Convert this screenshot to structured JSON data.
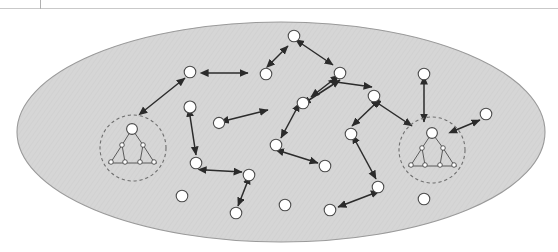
{
  "page": {
    "width": 558,
    "height": 252,
    "background": "#ffffff",
    "scan_rule": {
      "y": 8,
      "color": "#c9c9c9"
    },
    "scan_tick": {
      "x": 40,
      "height": 9,
      "color": "#b0b0b0"
    }
  },
  "figure": {
    "kind": "peer-to-peer network diagram",
    "universe": {
      "label": "network-boundary-ellipse",
      "cx": 281,
      "cy": 132,
      "rx": 264,
      "ry": 110,
      "fill": "#d6d6d6",
      "stroke": "#9a9a9a"
    },
    "colors": {
      "node_fill": "#ffffff",
      "node_stroke": "#4c4c4c",
      "arrow": "#2b2b2b",
      "group_ring": "#6f6f6f",
      "ellipse_fill": "#d6d6d6",
      "ellipse_stroke": "#9a9a9a"
    },
    "node_radius": 5.6,
    "nodes": [
      {
        "id": "n1",
        "cx": 190,
        "cy": 72,
        "r": 5.8
      },
      {
        "id": "n2",
        "cx": 266,
        "cy": 74,
        "r": 5.8
      },
      {
        "id": "n3",
        "cx": 294,
        "cy": 36,
        "r": 5.8
      },
      {
        "id": "n4",
        "cx": 340,
        "cy": 73,
        "r": 5.8
      },
      {
        "id": "n5",
        "cx": 374,
        "cy": 96,
        "r": 5.8
      },
      {
        "id": "n6",
        "cx": 424,
        "cy": 74,
        "r": 5.8
      },
      {
        "id": "n7",
        "cx": 190,
        "cy": 107,
        "r": 6.0
      },
      {
        "id": "n8",
        "cx": 219,
        "cy": 123,
        "r": 5.6
      },
      {
        "id": "n9",
        "cx": 303,
        "cy": 103,
        "r": 5.8
      },
      {
        "id": "n10",
        "cx": 351,
        "cy": 134,
        "r": 5.8
      },
      {
        "id": "n11",
        "cx": 486,
        "cy": 114,
        "r": 5.8
      },
      {
        "id": "n12",
        "cx": 276,
        "cy": 145,
        "r": 5.8
      },
      {
        "id": "n13",
        "cx": 196,
        "cy": 163,
        "r": 5.8
      },
      {
        "id": "n14",
        "cx": 249,
        "cy": 175,
        "r": 5.8
      },
      {
        "id": "n15",
        "cx": 325,
        "cy": 166,
        "r": 5.8
      },
      {
        "id": "n16",
        "cx": 378,
        "cy": 187,
        "r": 5.8
      },
      {
        "id": "n17",
        "cx": 182,
        "cy": 196,
        "r": 5.8
      },
      {
        "id": "n18",
        "cx": 236,
        "cy": 213,
        "r": 5.8
      },
      {
        "id": "n19",
        "cx": 285,
        "cy": 205,
        "r": 5.8
      },
      {
        "id": "n20",
        "cx": 330,
        "cy": 210,
        "r": 5.8
      },
      {
        "id": "n21",
        "cx": 424,
        "cy": 199,
        "r": 5.8
      }
    ],
    "links": [
      {
        "from": "g-left",
        "to": "n1",
        "x1": 145,
        "y1": 110,
        "x2": 185,
        "y2": 78,
        "heads": "both"
      },
      {
        "from": "n1",
        "to": "n2",
        "x1": 208,
        "y1": 73,
        "x2": 248,
        "y2": 73,
        "heads": "both"
      },
      {
        "from": "n2",
        "to": "n3",
        "x1": 272,
        "y1": 62,
        "x2": 288,
        "y2": 46,
        "heads": "both"
      },
      {
        "from": "n3",
        "to": "n4",
        "x1": 302,
        "y1": 44,
        "x2": 333,
        "y2": 65,
        "heads": "both"
      },
      {
        "from": "n4",
        "to": "n5",
        "x1": 336,
        "y1": 82,
        "x2": 372,
        "y2": 87,
        "heads": "both"
      },
      {
        "from": "n5",
        "to": "n10",
        "x1": 374,
        "y1": 105,
        "x2": 352,
        "y2": 126,
        "heads": "both"
      },
      {
        "from": "n4",
        "to": "n9",
        "x1": 333,
        "y1": 80,
        "x2": 311,
        "y2": 97,
        "heads": "both"
      },
      {
        "from": "n9",
        "to": "n12",
        "x1": 296,
        "y1": 110,
        "x2": 281,
        "y2": 138,
        "heads": "both"
      },
      {
        "from": "n7",
        "to": "n13",
        "x1": 190,
        "y1": 116,
        "x2": 196,
        "y2": 155,
        "heads": "both"
      },
      {
        "from": "n8",
        "to": "n12",
        "x1": 228,
        "y1": 120,
        "x2": 268,
        "y2": 110,
        "heads": "both"
      },
      {
        "from": "n12",
        "to": "n15",
        "x1": 283,
        "y1": 152,
        "x2": 318,
        "y2": 163,
        "heads": "both"
      },
      {
        "from": "n14",
        "to": "n18",
        "x1": 247,
        "y1": 183,
        "x2": 238,
        "y2": 206,
        "heads": "both"
      },
      {
        "from": "n13",
        "to": "n14",
        "x1": 206,
        "y1": 170,
        "x2": 242,
        "y2": 172,
        "heads": "both"
      },
      {
        "from": "n10",
        "to": "n16",
        "x1": 356,
        "y1": 142,
        "x2": 376,
        "y2": 179,
        "heads": "both"
      },
      {
        "from": "n16",
        "to": "n20",
        "x1": 372,
        "y1": 194,
        "x2": 338,
        "y2": 207,
        "heads": "both"
      },
      {
        "from": "n6",
        "to": "g-right",
        "x1": 424,
        "y1": 84,
        "x2": 424,
        "y2": 122,
        "heads": "both"
      },
      {
        "from": "g-right",
        "to": "n11",
        "x1": 456,
        "y1": 130,
        "x2": 480,
        "y2": 120,
        "heads": "both"
      },
      {
        "from": "n5",
        "to": "g-right",
        "x1": 379,
        "y1": 104,
        "x2": 412,
        "y2": 126,
        "heads": "both"
      },
      {
        "from": "n9",
        "to": "n5",
        "x1": 309,
        "y1": 100,
        "x2": 340,
        "y2": 80,
        "heads": "both"
      }
    ],
    "groups": [
      {
        "id": "g-left",
        "label": "clustered-subnetwork-left",
        "ring": {
          "cx": 133,
          "cy": 148,
          "r": 33
        },
        "tree": {
          "root": {
            "cx": 132,
            "cy": 129,
            "r": 5.4
          },
          "mids": [
            {
              "cx": 122,
              "cy": 145,
              "r": 2.3
            },
            {
              "cx": 143,
              "cy": 145,
              "r": 2.3
            }
          ],
          "leaves": [
            {
              "cx": 111,
              "cy": 162,
              "r": 2.3
            },
            {
              "cx": 125,
              "cy": 162,
              "r": 2.3
            },
            {
              "cx": 140,
              "cy": 162,
              "r": 2.3
            },
            {
              "cx": 154,
              "cy": 162,
              "r": 2.3
            }
          ],
          "base": {
            "x1": 108,
            "y1": 163,
            "x2": 157,
            "y2": 163
          }
        }
      },
      {
        "id": "g-right",
        "label": "clustered-subnetwork-right",
        "ring": {
          "cx": 432,
          "cy": 150,
          "r": 33
        },
        "tree": {
          "root": {
            "cx": 432,
            "cy": 133,
            "r": 5.4
          },
          "mids": [
            {
              "cx": 422,
              "cy": 148,
              "r": 2.3
            },
            {
              "cx": 443,
              "cy": 148,
              "r": 2.3
            }
          ],
          "leaves": [
            {
              "cx": 411,
              "cy": 165,
              "r": 2.3
            },
            {
              "cx": 425,
              "cy": 165,
              "r": 2.3
            },
            {
              "cx": 440,
              "cy": 165,
              "r": 2.3
            },
            {
              "cx": 454,
              "cy": 165,
              "r": 2.3
            }
          ],
          "base": {
            "x1": 408,
            "y1": 166,
            "x2": 457,
            "y2": 166
          }
        }
      }
    ]
  }
}
